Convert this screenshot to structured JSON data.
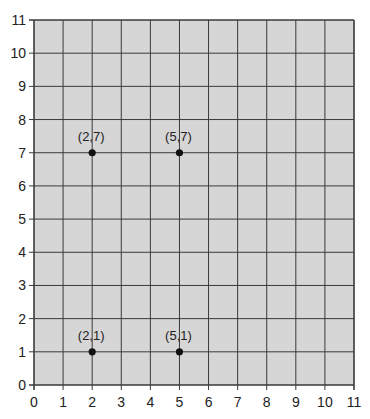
{
  "chart_data": {
    "type": "scatter",
    "title": "",
    "xlabel": "",
    "ylabel": "",
    "xlim": [
      0,
      11
    ],
    "ylim": [
      0,
      11
    ],
    "grid": true,
    "x_ticks": [
      0,
      1,
      2,
      3,
      4,
      5,
      6,
      7,
      8,
      9,
      10,
      11
    ],
    "y_ticks": [
      0,
      1,
      2,
      3,
      4,
      5,
      6,
      7,
      8,
      9,
      10,
      11
    ],
    "points": [
      {
        "x": 2,
        "y": 7,
        "label": "(2,7)"
      },
      {
        "x": 5,
        "y": 7,
        "label": "(5,7)"
      },
      {
        "x": 2,
        "y": 1,
        "label": "(2,1)"
      },
      {
        "x": 5,
        "y": 1,
        "label": "(5,1)"
      }
    ]
  },
  "colors": {
    "plot_background": "#d6d6d6",
    "grid_line": "#3a3a3a",
    "point": "#111111"
  }
}
